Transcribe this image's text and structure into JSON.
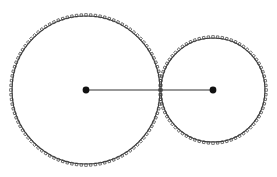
{
  "diagram": {
    "title": "",
    "colors": {
      "background": "#ffffff",
      "stroke": "#333333",
      "teeth": "#444444",
      "center_dot": "#111111"
    },
    "gears": [
      {
        "id": "large-gear",
        "cx": 86,
        "cy": 90,
        "radius": 74,
        "teeth": 100,
        "tooth_height": 2.6,
        "tooth_width": 2.4
      },
      {
        "id": "small-gear",
        "cx": 213,
        "cy": 90,
        "radius": 52,
        "teeth": 72,
        "tooth_height": 2.6,
        "tooth_width": 2.4
      }
    ],
    "center_line": {
      "x1": 86,
      "y1": 90,
      "x2": 213,
      "y2": 90
    },
    "center_dot_radius": 3.4
  }
}
